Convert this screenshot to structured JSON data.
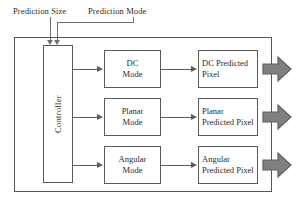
{
  "diagram": {
    "inputs": [
      {
        "label": "Prediction Size"
      },
      {
        "label": "Prediction Mode"
      }
    ],
    "controller": {
      "label": "Controller"
    },
    "rows": [
      {
        "mode_line1": "DC",
        "mode_line2": "Mode",
        "pixel_line1": "DC Predicted",
        "pixel_line2": "Pixel"
      },
      {
        "mode_line1": "Planar",
        "mode_line2": "Mode",
        "pixel_line1": "Planar",
        "pixel_line2": "Predicted Pixel"
      },
      {
        "mode_line1": "Angular",
        "mode_line2": "Mode",
        "pixel_line1": "Angular",
        "pixel_line2": "Predicted Pixel"
      }
    ],
    "colors": {
      "frame_stroke": "#555555",
      "box_stroke": "#5a5a5a",
      "text": "#2b2b2b",
      "leader_stroke": "#6f6f6f",
      "big_arrow_fill": "#808080",
      "big_arrow_stroke": "#5f5f5f",
      "background": "#ffffff"
    }
  }
}
